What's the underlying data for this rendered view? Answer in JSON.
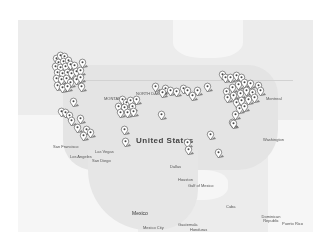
{
  "map": {
    "labels": {
      "united_states": "United States",
      "mexico": "Mexico",
      "mexico_city": "Mexico City",
      "cuba": "Cuba",
      "dominican_republic": "Dominican Republic",
      "puerto_rico": "Puerto Rico",
      "guatemala": "Guatemala",
      "honduras": "Honduras",
      "las_vegas": "Las Vegas",
      "san_diego": "San Diego",
      "los_angeles": "Los Angeles",
      "san_francisco": "San Francisco",
      "dallas": "Dallas",
      "houston": "Houston",
      "ottawa": "Ottawa",
      "montreal": "Montreal",
      "washington": "Washington",
      "montana": "MONTANA",
      "north_dakota": "NORTH DAKOTA",
      "gulf_of_mexico": "Gulf of Mexico"
    },
    "pins": [
      {
        "x": 56,
        "y": 64
      },
      {
        "x": 60,
        "y": 61
      },
      {
        "x": 64,
        "y": 62
      },
      {
        "x": 58,
        "y": 68
      },
      {
        "x": 63,
        "y": 67
      },
      {
        "x": 68,
        "y": 66
      },
      {
        "x": 55,
        "y": 72
      },
      {
        "x": 60,
        "y": 73
      },
      {
        "x": 65,
        "y": 72
      },
      {
        "x": 70,
        "y": 70
      },
      {
        "x": 74,
        "y": 71
      },
      {
        "x": 82,
        "y": 68
      },
      {
        "x": 57,
        "y": 78
      },
      {
        "x": 62,
        "y": 79
      },
      {
        "x": 67,
        "y": 78
      },
      {
        "x": 71,
        "y": 79
      },
      {
        "x": 76,
        "y": 77
      },
      {
        "x": 80,
        "y": 76
      },
      {
        "x": 56,
        "y": 84
      },
      {
        "x": 61,
        "y": 85
      },
      {
        "x": 66,
        "y": 84
      },
      {
        "x": 70,
        "y": 88
      },
      {
        "x": 76,
        "y": 85
      },
      {
        "x": 80,
        "y": 83
      },
      {
        "x": 57,
        "y": 91
      },
      {
        "x": 62,
        "y": 93
      },
      {
        "x": 67,
        "y": 92
      },
      {
        "x": 81,
        "y": 92
      },
      {
        "x": 73,
        "y": 107
      },
      {
        "x": 61,
        "y": 117
      },
      {
        "x": 65,
        "y": 118
      },
      {
        "x": 69,
        "y": 121
      },
      {
        "x": 71,
        "y": 126
      },
      {
        "x": 80,
        "y": 124
      },
      {
        "x": 77,
        "y": 133
      },
      {
        "x": 86,
        "y": 135
      },
      {
        "x": 83,
        "y": 141
      },
      {
        "x": 90,
        "y": 138
      },
      {
        "x": 122,
        "y": 105
      },
      {
        "x": 126,
        "y": 108
      },
      {
        "x": 130,
        "y": 106
      },
      {
        "x": 118,
        "y": 112
      },
      {
        "x": 124,
        "y": 113
      },
      {
        "x": 132,
        "y": 112
      },
      {
        "x": 127,
        "y": 118
      },
      {
        "x": 133,
        "y": 117
      },
      {
        "x": 120,
        "y": 118
      },
      {
        "x": 136,
        "y": 105
      },
      {
        "x": 155,
        "y": 92
      },
      {
        "x": 165,
        "y": 94
      },
      {
        "x": 162,
        "y": 98
      },
      {
        "x": 170,
        "y": 96
      },
      {
        "x": 176,
        "y": 97
      },
      {
        "x": 183,
        "y": 94
      },
      {
        "x": 187,
        "y": 96
      },
      {
        "x": 192,
        "y": 101
      },
      {
        "x": 197,
        "y": 96
      },
      {
        "x": 207,
        "y": 92
      },
      {
        "x": 222,
        "y": 80
      },
      {
        "x": 225,
        "y": 83
      },
      {
        "x": 230,
        "y": 83
      },
      {
        "x": 236,
        "y": 81
      },
      {
        "x": 241,
        "y": 83
      },
      {
        "x": 226,
        "y": 97
      },
      {
        "x": 232,
        "y": 93
      },
      {
        "x": 238,
        "y": 90
      },
      {
        "x": 244,
        "y": 88
      },
      {
        "x": 250,
        "y": 89
      },
      {
        "x": 258,
        "y": 91
      },
      {
        "x": 227,
        "y": 103
      },
      {
        "x": 233,
        "y": 101
      },
      {
        "x": 240,
        "y": 99
      },
      {
        "x": 246,
        "y": 96
      },
      {
        "x": 252,
        "y": 98
      },
      {
        "x": 260,
        "y": 96
      },
      {
        "x": 236,
        "y": 108
      },
      {
        "x": 241,
        "y": 106
      },
      {
        "x": 248,
        "y": 105
      },
      {
        "x": 254,
        "y": 103
      },
      {
        "x": 239,
        "y": 114
      },
      {
        "x": 244,
        "y": 112
      },
      {
        "x": 235,
        "y": 120
      },
      {
        "x": 232,
        "y": 128
      },
      {
        "x": 161,
        "y": 120
      },
      {
        "x": 124,
        "y": 135
      },
      {
        "x": 125,
        "y": 147
      },
      {
        "x": 187,
        "y": 148
      },
      {
        "x": 188,
        "y": 155
      },
      {
        "x": 210,
        "y": 140
      },
      {
        "x": 218,
        "y": 158
      },
      {
        "x": 233,
        "y": 129
      }
    ]
  }
}
